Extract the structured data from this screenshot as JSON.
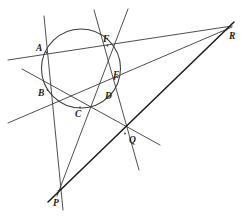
{
  "figure": {
    "kind": "geometry-diagram",
    "width": 244,
    "height": 216,
    "background_color": "#ffffff",
    "line_color": "#3a3a3a",
    "pascal_line_color": "#1a1a1a",
    "circle_color": "#3a3a3a"
  },
  "circle": {
    "name": "circumscribed-circle",
    "cx": 81,
    "cy": 68.5,
    "r": 39.5
  },
  "points": [
    {
      "id": "A",
      "label": "A",
      "x": 46.5,
      "y": 52.5,
      "label_x": 36,
      "label_y": 44,
      "on_circle": true
    },
    {
      "id": "B",
      "label": "B",
      "x": 47.5,
      "y": 90.0,
      "label_x": 38,
      "label_y": 89,
      "on_circle": true
    },
    {
      "id": "C",
      "label": "C",
      "x": 80.0,
      "y": 107.5,
      "label_x": 75,
      "label_y": 110,
      "on_circle": true
    },
    {
      "id": "D",
      "label": "D",
      "x": 108.5,
      "y": 96.5,
      "label_x": 105,
      "label_y": 92,
      "on_circle": true
    },
    {
      "id": "E",
      "label": "E",
      "x": 114.5,
      "y": 79.0,
      "label_x": 113,
      "label_y": 71,
      "on_circle": true
    },
    {
      "id": "F",
      "label": "F",
      "x": 107.5,
      "y": 45.5,
      "label_x": 103,
      "label_y": 35,
      "on_circle": true
    },
    {
      "id": "P",
      "label": "P",
      "x": 58.5,
      "y": 191.0,
      "label_x": 53,
      "label_y": 199,
      "on_circle": false
    },
    {
      "id": "Q",
      "label": "Q",
      "x": 125.0,
      "y": 133.5,
      "label_x": 129,
      "label_y": 136,
      "on_circle": false
    },
    {
      "id": "R",
      "label": "R",
      "x": 226.5,
      "y": 29.5,
      "label_x": 229,
      "label_y": 32,
      "on_circle": false
    }
  ],
  "lines": [
    {
      "id": "AF",
      "name": "line-AF-to-R",
      "x1": 8,
      "y1": 60,
      "x2": 232,
      "y2": 26,
      "weight": 0.9
    },
    {
      "id": "CD",
      "name": "line-CD-to-R",
      "x1": 8,
      "y1": 123,
      "x2": 232,
      "y2": 27,
      "weight": 0.9
    },
    {
      "id": "BC",
      "name": "line-BC-to-Q",
      "x1": 22,
      "y1": 69,
      "x2": 160,
      "y2": 145,
      "weight": 0.9
    },
    {
      "id": "EF",
      "name": "line-EF-to-Q",
      "x1": 94,
      "y1": 10,
      "x2": 139,
      "y2": 170,
      "weight": 0.9
    },
    {
      "id": "AB",
      "name": "line-AB-to-P",
      "x1": 44,
      "y1": 16,
      "x2": 63,
      "y2": 210,
      "weight": 0.9
    },
    {
      "id": "DE",
      "name": "line-DE-to-P",
      "x1": 128,
      "y1": 9,
      "x2": 57,
      "y2": 196,
      "weight": 0.9
    },
    {
      "id": "PQR",
      "name": "pascal-line-PQR",
      "x1": 48,
      "y1": 202,
      "x2": 234,
      "y2": 22,
      "weight": 1.5
    }
  ]
}
